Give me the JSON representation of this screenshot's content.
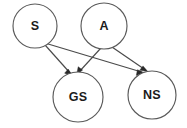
{
  "diagram": {
    "type": "directed-acyclic-graph",
    "title": "",
    "background_color": "#ffffff",
    "node_stroke_color": "#5a5a5a",
    "edge_stroke_color": "#4a4a4a",
    "label_color": "#1b1b1b",
    "arrowhead_color": "#2a2a2a",
    "nodes": [
      {
        "id": "S",
        "label": "S",
        "cx": 35,
        "cy": 26,
        "r": 22
      },
      {
        "id": "A",
        "label": "A",
        "cx": 104,
        "cy": 26,
        "r": 23
      },
      {
        "id": "GS",
        "label": "GS",
        "cx": 78,
        "cy": 97,
        "r": 25
      },
      {
        "id": "NS",
        "label": "NS",
        "cx": 152,
        "cy": 95,
        "r": 24
      }
    ],
    "edges": [
      {
        "id": "S-GS",
        "from": "S",
        "to": "GS",
        "directed": true
      },
      {
        "id": "S-NS",
        "from": "S",
        "to": "NS",
        "directed": true
      },
      {
        "id": "A-GS",
        "from": "A",
        "to": "GS",
        "directed": true
      },
      {
        "id": "A-NS",
        "from": "A",
        "to": "NS",
        "directed": true
      }
    ]
  }
}
